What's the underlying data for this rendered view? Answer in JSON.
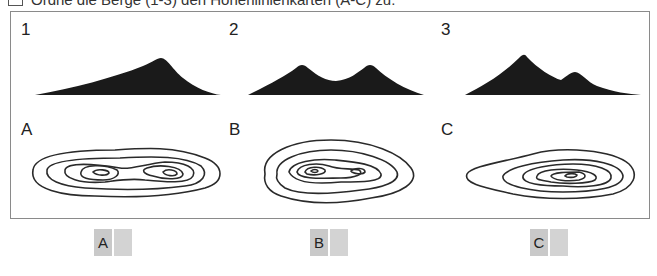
{
  "heading": {
    "icon": "checkbox-icon",
    "text": "Ordne die Berge (1-3) den Höhenlinienkarten (A-C) zu."
  },
  "mountains": [
    {
      "label": "1"
    },
    {
      "label": "2"
    },
    {
      "label": "3"
    }
  ],
  "contour_maps": [
    {
      "label": "A"
    },
    {
      "label": "B"
    },
    {
      "label": "C"
    }
  ],
  "answers": [
    {
      "label": "A",
      "value": ""
    },
    {
      "label": "B",
      "value": ""
    },
    {
      "label": "C",
      "value": ""
    }
  ],
  "colors": {
    "silhouette": "#1a1a1a",
    "contour_line": "#2a2a2a",
    "frame_border": "#8a8a8a",
    "answer_tag_bg": "#c9c9c9",
    "answer_slot_bg": "#d3d3d3"
  }
}
